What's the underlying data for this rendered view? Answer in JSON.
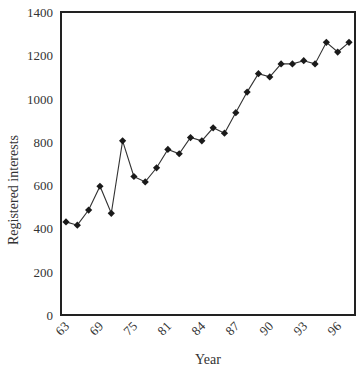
{
  "chart_data": {
    "type": "line",
    "title": "",
    "xlabel": "Year",
    "ylabel": "Registered interests",
    "ylim": [
      0,
      1400
    ],
    "yticks": [
      0,
      200,
      400,
      600,
      800,
      1000,
      1200,
      1400
    ],
    "xtick_labels": [
      "63",
      "69",
      "75",
      "81",
      "84",
      "87",
      "90",
      "93",
      "96"
    ],
    "grid": false,
    "legend": null,
    "marker": "diamond",
    "series": [
      {
        "name": "Registered interests",
        "values": [
          430,
          415,
          485,
          595,
          470,
          805,
          640,
          615,
          680,
          765,
          745,
          820,
          805,
          865,
          840,
          935,
          1030,
          1115,
          1100,
          1160,
          1160,
          1175,
          1160,
          1260,
          1215,
          1260
        ]
      }
    ]
  },
  "colors": {
    "line": "#333333",
    "marker": "#1a1a1a",
    "axis": "#222222"
  }
}
